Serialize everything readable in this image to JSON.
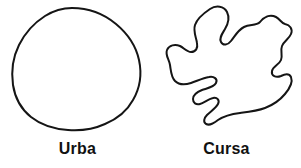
{
  "figure": {
    "background_color": "#ffffff",
    "stroke_color": "#151515",
    "caption_color": "#111111",
    "width": 301,
    "height": 168
  },
  "panels": [
    {
      "id": "urba",
      "caption": "Urba",
      "shape_name": "smooth-round-blob-outline",
      "description": "closed smooth near-circular irregular outline"
    },
    {
      "id": "cursa",
      "caption": "Cursa",
      "shape_name": "convoluted-irregular-blob-outline",
      "description": "closed highly convoluted outline with deep lobes and concavities"
    }
  ]
}
